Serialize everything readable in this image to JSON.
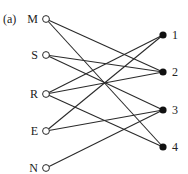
{
  "figure": {
    "panel_label": "(a)",
    "left_nodes": [
      {
        "id": "M",
        "label": "M",
        "x": 46,
        "y": 19
      },
      {
        "id": "S",
        "label": "S",
        "x": 46,
        "y": 55
      },
      {
        "id": "R",
        "label": "R",
        "x": 46,
        "y": 94
      },
      {
        "id": "E",
        "label": "E",
        "x": 46,
        "y": 131
      },
      {
        "id": "N",
        "label": "N",
        "x": 46,
        "y": 168
      }
    ],
    "right_nodes": [
      {
        "id": "1",
        "label": "1",
        "x": 163,
        "y": 35
      },
      {
        "id": "2",
        "label": "2",
        "x": 163,
        "y": 72
      },
      {
        "id": "3",
        "label": "3",
        "x": 163,
        "y": 110
      },
      {
        "id": "4",
        "label": "4",
        "x": 163,
        "y": 147
      }
    ],
    "edges": [
      [
        "M",
        "2"
      ],
      [
        "M",
        "4"
      ],
      [
        "S",
        "2"
      ],
      [
        "S",
        "3"
      ],
      [
        "R",
        "1"
      ],
      [
        "R",
        "2"
      ],
      [
        "R",
        "4"
      ],
      [
        "E",
        "1"
      ],
      [
        "E",
        "3"
      ],
      [
        "N",
        "3"
      ]
    ],
    "style": {
      "line_color": "#2a2a2a",
      "open_node_fill": "#ffffff",
      "filled_node_fill": "#111111"
    }
  }
}
